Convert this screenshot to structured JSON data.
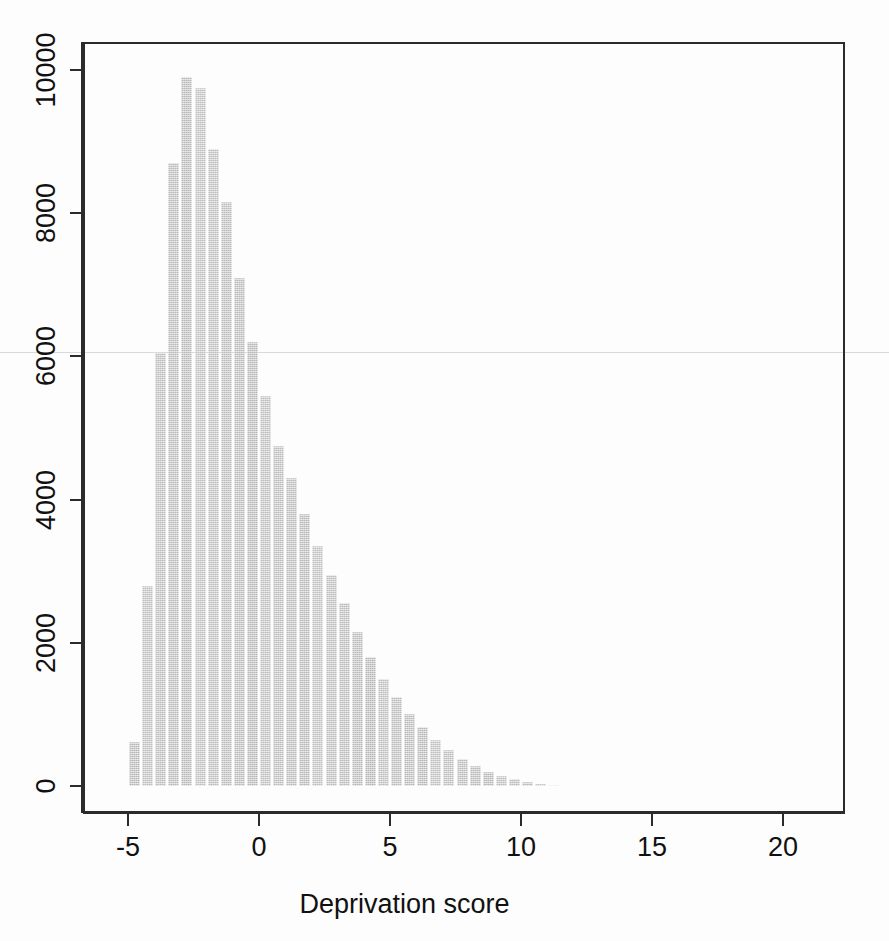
{
  "figure": {
    "type": "histogram-figure",
    "background": "#ffffff",
    "bar_color": "#b9b9b9",
    "axis_color": "#2b2b2b"
  },
  "axes": {
    "x_title": "Deprivation score",
    "y_title": "",
    "x_ticks": [
      "-5",
      "0",
      "5",
      "10",
      "15",
      "20"
    ],
    "y_ticks": [
      "0",
      "2000",
      "4000",
      "6000",
      "8000",
      "10000"
    ]
  },
  "chart_data": {
    "type": "bar",
    "title": "",
    "subtitle": "",
    "xlabel": "Deprivation score",
    "ylabel": "",
    "xlim": [
      -5.8,
      23.3
    ],
    "ylim": [
      0,
      10800
    ],
    "grid": false,
    "legend": null,
    "bin_width": 0.5,
    "xticks": [
      -5,
      0,
      5,
      10,
      15,
      20
    ],
    "yticks": [
      0,
      2000,
      4000,
      6000,
      8000,
      10000
    ],
    "bin_starts": [
      -5.0,
      -4.5,
      -4.0,
      -3.5,
      -3.0,
      -2.5,
      -2.0,
      -1.5,
      -1.0,
      -0.5,
      0.0,
      0.5,
      1.0,
      1.5,
      2.0,
      2.5,
      3.0,
      3.5,
      4.0,
      4.5,
      5.0,
      5.5,
      6.0,
      6.5,
      7.0,
      7.5,
      8.0,
      8.5,
      9.0,
      9.5,
      10.0,
      10.5,
      11.0
    ],
    "categories": [
      "-5.0",
      "-4.5",
      "-4.0",
      "-3.5",
      "-3.0",
      "-2.5",
      "-2.0",
      "-1.5",
      "-1.0",
      "-0.5",
      "0.0",
      "0.5",
      "1.0",
      "1.5",
      "2.0",
      "2.5",
      "3.0",
      "3.5",
      "4.0",
      "4.5",
      "5.0",
      "5.5",
      "6.0",
      "6.5",
      "7.0",
      "7.5",
      "8.0",
      "8.5",
      "9.0",
      "9.5",
      "10.0",
      "10.5",
      "11.0"
    ],
    "values": [
      620,
      2800,
      6050,
      8700,
      9900,
      9750,
      8900,
      8150,
      7100,
      6200,
      5450,
      4750,
      4300,
      3800,
      3350,
      2950,
      2550,
      2150,
      1800,
      1500,
      1250,
      1000,
      820,
      640,
      500,
      380,
      280,
      200,
      140,
      95,
      60,
      35,
      18
    ]
  }
}
